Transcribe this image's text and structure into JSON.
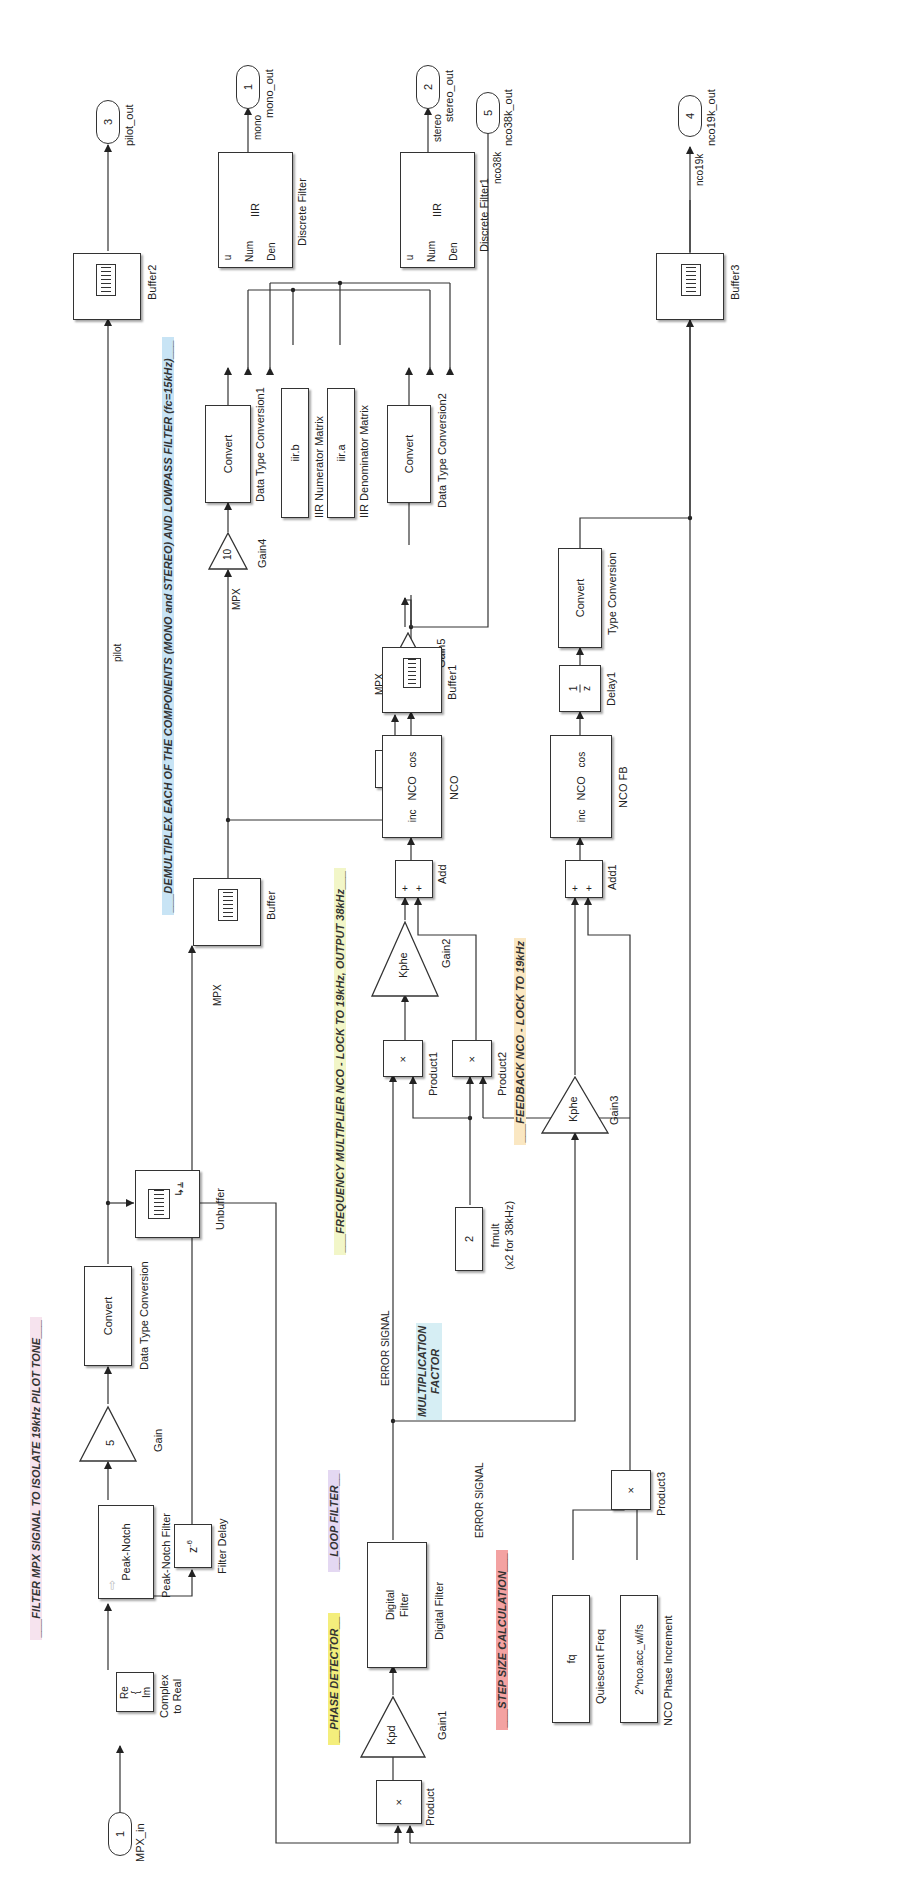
{
  "annotations": {
    "filter_mpx": {
      "text": "___FILTER MPX SIGNAL TO ISOLATE 19kHz PILOT TONE___",
      "color": "#f4dbe8"
    },
    "demultiplex": {
      "text": "___DEMULTIPLEX EACH OF THE COMPONENTS (MONO and STEREO) AND LOWPASS FILTER (fc=15kHz)___",
      "color": "#bfe0f3"
    },
    "freq_mult_nco": {
      "text": "___FREQUENCY MULTIPLIER NCO - LOCK TO 19kHz, OUTPUT 38kHz___",
      "color": "#f0f4c4"
    },
    "feedback_nco": {
      "text": "___FEEDBACK NCO - LOCK TO 19kHz",
      "color": "#fbe6bf"
    },
    "phase_detector": {
      "text": "__PHASE DETECTOR__",
      "color": "#f6f07a"
    },
    "loop_filter": {
      "text": "__LOOP FILTER__",
      "color": "#e2d6f2"
    },
    "mult_factor": {
      "text": "MULTIPLICATION\nFACTOR",
      "line1": "MULTIPLICATION",
      "line2": "FACTOR",
      "color": "#d4eef4"
    },
    "step_size": {
      "text": "___STEP SIZE CALCULATION___",
      "color": "#f4a0a0"
    }
  },
  "ports": {
    "mpx_in": {
      "number": "1",
      "label": "MPX_in"
    },
    "mono_out": {
      "number": "1",
      "label": "mono_out"
    },
    "stereo_out": {
      "number": "2",
      "label": "stereo_out"
    },
    "pilot_out": {
      "number": "3",
      "label": "pilot_out"
    },
    "nco19k_out": {
      "number": "4",
      "label": "nco19k_out"
    },
    "nco38k_out": {
      "number": "5",
      "label": "nco38k_out"
    }
  },
  "blocks": {
    "complex_to_real": {
      "re": "Re",
      "im": "Im",
      "label_line1": "Complex",
      "label_line2": "to Real"
    },
    "peak_notch": {
      "text": "Peak-Notch",
      "label": "Peak-Notch Filter"
    },
    "gain": {
      "value": "5",
      "label": "Gain"
    },
    "dtc": {
      "text": "Convert",
      "label": "Data Type Conversion"
    },
    "unbuffer": {
      "label": "Unbuffer"
    },
    "buffer2": {
      "label": "Buffer2"
    },
    "filter_delay": {
      "text": "z",
      "exp": "-6",
      "label": "Filter Delay"
    },
    "buffer": {
      "label": "Buffer"
    },
    "gain4": {
      "value": "10",
      "label": "Gain4"
    },
    "dtc1": {
      "text": "Convert",
      "label": "Data Type Conversion1"
    },
    "iir_num": {
      "text": "iir.b",
      "label": "IIR Numerator Matrix"
    },
    "iir_den": {
      "text": "iir.a",
      "label": "IIR Denominator Matrix"
    },
    "discrete_filter": {
      "u": "u",
      "num": "Num",
      "den": "Den",
      "text": "IIR",
      "label": "Discrete Filter"
    },
    "product4": {
      "text": "×",
      "label": "Product4"
    },
    "gain5": {
      "value": "20",
      "label": "Gain5"
    },
    "dtc2": {
      "text": "Convert",
      "label": "Data Type Conversion2"
    },
    "discrete_filter1": {
      "u": "u",
      "num": "Num",
      "den": "Den",
      "text": "IIR",
      "label": "Discrete Filter1"
    },
    "product": {
      "text": "×",
      "label": "Product"
    },
    "gain1": {
      "value": "Kpd",
      "label": "Gain1"
    },
    "digital_filter": {
      "line1": "Digital",
      "line2": "Filter",
      "label": "Digital Filter"
    },
    "product1": {
      "text": "×",
      "label": "Product1"
    },
    "gain2": {
      "value": "Kphe",
      "label": "Gain2"
    },
    "add": {
      "p1": "+",
      "p2": "+",
      "label": "Add"
    },
    "nco": {
      "inc": "inc",
      "text": "NCO",
      "cos": "cos",
      "label": "NCO"
    },
    "buffer1": {
      "label": "Buffer1"
    },
    "fmult": {
      "value": "2",
      "label_line1": "fmult",
      "label_line2": "(x2 for 38kHz)"
    },
    "product2": {
      "text": "×",
      "label": "Product2"
    },
    "gain3": {
      "value": "Kphe",
      "label": "Gain3"
    },
    "add1": {
      "p1": "+",
      "p2": "+",
      "label": "Add1"
    },
    "nco_fb": {
      "inc": "inc",
      "text": "NCO",
      "cos": "cos",
      "label": "NCO FB"
    },
    "delay1": {
      "num": "1",
      "den": "z",
      "label": "Delay1"
    },
    "type_conversion": {
      "text": "Convert",
      "label": "Type Conversion"
    },
    "buffer3": {
      "label": "Buffer3"
    },
    "quiescent": {
      "text": "fq",
      "label": "Quiescent Freq"
    },
    "phase_inc": {
      "text": "2^nco.acc_wl/fs",
      "label": "NCO Phase Increment"
    },
    "product3": {
      "text": "×",
      "label": "Product3"
    }
  },
  "signals": {
    "pilot": "pilot",
    "mpx_a": "MPX",
    "mpx_b": "MPX",
    "mpx_c": "MPX",
    "nco38k_a": "nco38k",
    "nco38k_b": "nco38k",
    "mono": "mono",
    "stereo": "stereo",
    "nco19k": "nco19k",
    "error1": "ERROR SIGNAL",
    "error2": "ERROR SIGNAL"
  }
}
